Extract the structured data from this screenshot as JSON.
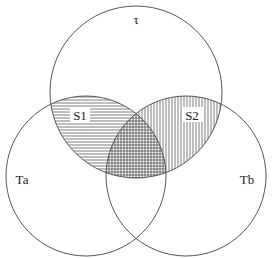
{
  "diagram": {
    "type": "venn",
    "caption": "",
    "sets": [
      {
        "id": "tau",
        "label": "τ",
        "cx": 136,
        "cy": 92,
        "r": 86
      },
      {
        "id": "Ta",
        "label": "Ta",
        "cx": 86,
        "cy": 176,
        "r": 80
      },
      {
        "id": "Tb",
        "label": "Tb",
        "cx": 186,
        "cy": 176,
        "r": 80
      }
    ],
    "regions": [
      {
        "id": "S1",
        "label": "S1",
        "sets": [
          "tau",
          "Ta"
        ],
        "pattern": "horizontal-hatch"
      },
      {
        "id": "S2",
        "label": "S2",
        "sets": [
          "tau",
          "Tb"
        ],
        "pattern": "vertical-hatch"
      },
      {
        "id": "S1S2",
        "label": "",
        "sets": [
          "tau",
          "Ta",
          "Tb"
        ],
        "pattern": "crosshatch"
      }
    ],
    "colors": {
      "stroke": "#555555",
      "hatch": "#444444",
      "background": "#ffffff"
    }
  }
}
